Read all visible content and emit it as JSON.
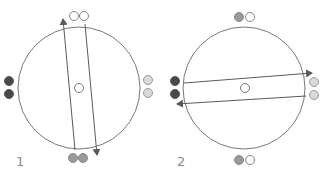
{
  "colors": {
    "line": "#6a6a6a",
    "dot_dark": "#4a4a4a",
    "dot_mid": "#9a9a9a",
    "dot_light": "#d9d9d9",
    "dot_white": "#ffffff",
    "label": "#8a8a8a"
  },
  "panels": [
    {
      "label": "1",
      "circle": {
        "cx": 79,
        "cy": 88,
        "r": 61
      },
      "center_marker": {
        "cx": 79,
        "cy": 88,
        "r": 4.5
      },
      "dots": {
        "top": [
          "white",
          "white"
        ],
        "bottom": [
          "mid",
          "mid"
        ],
        "left": [
          "dark",
          "dark"
        ],
        "right": [
          "light",
          "light"
        ]
      },
      "band_orientation": "near-vertical",
      "arrows": [
        "up (left line)",
        "down (right line)"
      ]
    },
    {
      "label": "2",
      "circle": {
        "cx": 244,
        "cy": 88,
        "r": 61
      },
      "center_marker": {
        "cx": 245,
        "cy": 88,
        "r": 4.5
      },
      "dots": {
        "top": [
          "mid",
          "white"
        ],
        "bottom": [
          "mid",
          "white"
        ],
        "left": [
          "dark",
          "dark"
        ],
        "right": [
          "light",
          "light"
        ]
      },
      "band_orientation": "near-horizontal",
      "arrows": [
        "right (top line)",
        "left (bottom line)"
      ]
    }
  ]
}
